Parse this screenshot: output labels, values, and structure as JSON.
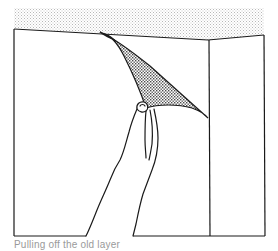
{
  "figure": {
    "caption": "Pulling off the old layer",
    "elements": {
      "ceiling": "stippled ceiling band",
      "left_wall": "left wall panel",
      "right_wall": "right wall panel (corner)",
      "peeled_strip": "stippled wallpaper flap being pulled away",
      "hand": "hand gripping the flap"
    }
  },
  "colors": {
    "line": "#1a1a1a",
    "stipple": "#b8b8b8",
    "stipple_dark": "#5c5c5c",
    "background": "#ffffff",
    "caption": "#9a9a9a"
  }
}
